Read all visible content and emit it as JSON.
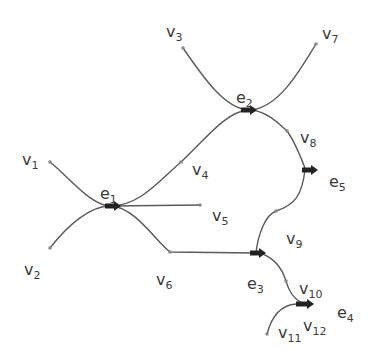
{
  "diagram": {
    "type": "hypergraph",
    "vertices": [
      {
        "id": "v1",
        "name": "v",
        "sub": "1",
        "x": 22,
        "y": 152
      },
      {
        "id": "v2",
        "name": "v",
        "sub": "2",
        "x": 24,
        "y": 262
      },
      {
        "id": "v3",
        "name": "v",
        "sub": "3",
        "x": 166,
        "y": 24
      },
      {
        "id": "v4",
        "name": "v",
        "sub": "4",
        "x": 192,
        "y": 162
      },
      {
        "id": "v5",
        "name": "v",
        "sub": "5",
        "x": 212,
        "y": 208
      },
      {
        "id": "v6",
        "name": "v",
        "sub": "6",
        "x": 156,
        "y": 272
      },
      {
        "id": "v7",
        "name": "v",
        "sub": "7",
        "x": 322,
        "y": 26
      },
      {
        "id": "v8",
        "name": "v",
        "sub": "8",
        "x": 300,
        "y": 130
      },
      {
        "id": "v9",
        "name": "v",
        "sub": "9",
        "x": 286,
        "y": 231
      },
      {
        "id": "v10",
        "name": "v",
        "sub": "10",
        "x": 299,
        "y": 281
      },
      {
        "id": "v11",
        "name": "v",
        "sub": "11",
        "x": 278,
        "y": 325
      },
      {
        "id": "v12",
        "name": "v",
        "sub": "12",
        "x": 303,
        "y": 318
      }
    ],
    "hyperedges": [
      {
        "id": "e1",
        "name": "e",
        "sub": "1",
        "x": 100,
        "y": 186
      },
      {
        "id": "e2",
        "name": "e",
        "sub": "2",
        "x": 236,
        "y": 90
      },
      {
        "id": "e3",
        "name": "e",
        "sub": "3",
        "x": 247,
        "y": 276
      },
      {
        "id": "e4",
        "name": "e",
        "sub": "4",
        "x": 337,
        "y": 305
      },
      {
        "id": "e5",
        "name": "e",
        "sub": "5",
        "x": 329,
        "y": 174
      }
    ],
    "colors": {
      "line": "#5a5a5a",
      "arrow": "#222222",
      "text": "#3a3a3a"
    }
  }
}
